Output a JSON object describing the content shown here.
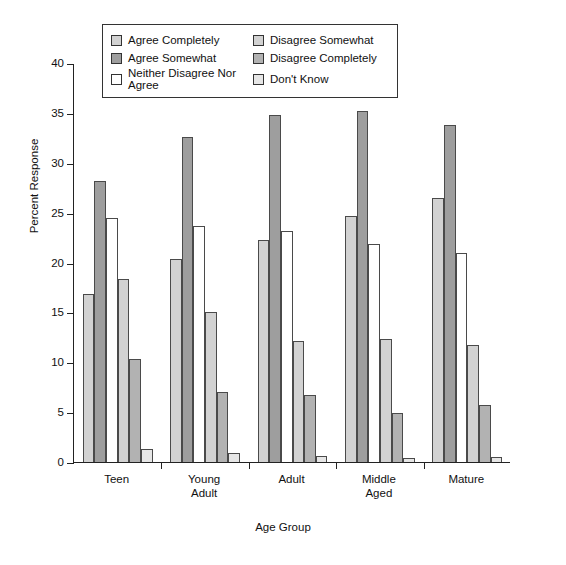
{
  "chart_data": {
    "type": "bar",
    "title": "",
    "xlabel": "Age Group",
    "ylabel": "Percent Response",
    "ylim": [
      0,
      40
    ],
    "yticks": [
      0,
      5,
      10,
      15,
      20,
      25,
      30,
      35,
      40
    ],
    "grid": false,
    "legend_position": "top-center",
    "categories": [
      "Teen",
      "Young\nAdult",
      "Adult",
      "Middle\nAged",
      "Mature"
    ],
    "series": [
      {
        "name": "Agree Completely",
        "color": "#d2d2d2",
        "values": [
          16.8,
          20.4,
          22.3,
          24.7,
          26.5
        ]
      },
      {
        "name": "Agree Somewhat",
        "color": "#9e9e9e",
        "values": [
          28.2,
          32.6,
          34.8,
          35.2,
          33.8
        ]
      },
      {
        "name": "Neither Disagree Nor Agree",
        "color": "#ffffff",
        "values": [
          24.5,
          23.7,
          23.2,
          21.9,
          21.0
        ]
      },
      {
        "name": "Disagree Somewhat",
        "color": "#d2d2d2",
        "values": [
          18.3,
          15.0,
          12.1,
          12.3,
          11.7
        ]
      },
      {
        "name": "Disagree Completely",
        "color": "#b2b2b2",
        "values": [
          10.3,
          7.0,
          6.7,
          4.9,
          5.7
        ]
      },
      {
        "name": "Don't Know",
        "color": "#e6e6e6",
        "values": [
          1.3,
          0.9,
          0.6,
          0.4,
          0.5
        ]
      }
    ]
  }
}
